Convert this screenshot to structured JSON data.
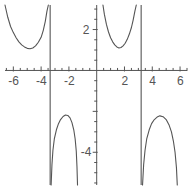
{
  "chart_data": {
    "type": "line",
    "title": "",
    "subtitle": "",
    "xlabel": "",
    "ylabel": "",
    "xlim": [
      -6.6,
      6.5
    ],
    "ylim": [
      -5.6,
      3.2
    ],
    "grid": false,
    "legend": null,
    "axis_color": "#555555",
    "curve_color": "#555555",
    "background": "#ffffff",
    "x_ticks_labeled": [
      -6,
      -4,
      -2,
      2,
      4,
      6
    ],
    "x_tick_labels": [
      "-6",
      "-4",
      "-2",
      "2",
      "4",
      "6"
    ],
    "x_minor_tick_step": 0.5,
    "y_ticks_labeled": [
      2,
      -4
    ],
    "y_tick_labels": [
      "2",
      "-4"
    ],
    "y_minor_tick_step": 0.5,
    "asymptotes": [
      -3.35,
      3.2
    ],
    "annotations": [],
    "series": [
      {
        "name": "upper-left-branch",
        "description": "U-shaped branch opening upward, left of the x = -3.35 asymptote",
        "points": [
          [
            -6.6,
            3.2
          ],
          [
            -6.4,
            2.6
          ],
          [
            -6.2,
            2.15
          ],
          [
            -6.0,
            1.85
          ],
          [
            -5.8,
            1.6
          ],
          [
            -5.6,
            1.4
          ],
          [
            -5.4,
            1.25
          ],
          [
            -5.2,
            1.15
          ],
          [
            -5.0,
            1.08
          ],
          [
            -4.8,
            1.06
          ],
          [
            -4.6,
            1.1
          ],
          [
            -4.4,
            1.2
          ],
          [
            -4.2,
            1.38
          ],
          [
            -4.0,
            1.62
          ],
          [
            -3.85,
            1.95
          ],
          [
            -3.7,
            2.4
          ],
          [
            -3.58,
            2.9
          ],
          [
            -3.48,
            3.2
          ]
        ]
      },
      {
        "name": "upper-right-branch",
        "description": "U-shaped branch opening upward, between the y-axis and the x = 3.2 asymptote",
        "points": [
          [
            0.45,
            3.2
          ],
          [
            0.55,
            2.75
          ],
          [
            0.7,
            2.25
          ],
          [
            0.85,
            1.88
          ],
          [
            1.0,
            1.6
          ],
          [
            1.15,
            1.4
          ],
          [
            1.3,
            1.25
          ],
          [
            1.45,
            1.15
          ],
          [
            1.6,
            1.1
          ],
          [
            1.75,
            1.12
          ],
          [
            1.9,
            1.2
          ],
          [
            2.05,
            1.33
          ],
          [
            2.2,
            1.52
          ],
          [
            2.35,
            1.78
          ],
          [
            2.5,
            2.1
          ],
          [
            2.62,
            2.45
          ],
          [
            2.75,
            2.9
          ],
          [
            2.85,
            3.2
          ]
        ]
      },
      {
        "name": "lower-middle-branch",
        "description": "Inverted U (arch) below the x-axis, just right of the x = -3.35 asymptote",
        "points": [
          [
            -3.28,
            -5.6
          ],
          [
            -3.22,
            -4.6
          ],
          [
            -3.15,
            -3.9
          ],
          [
            -3.05,
            -3.35
          ],
          [
            -2.9,
            -2.9
          ],
          [
            -2.75,
            -2.6
          ],
          [
            -2.6,
            -2.4
          ],
          [
            -2.42,
            -2.25
          ],
          [
            -2.25,
            -2.18
          ],
          [
            -2.08,
            -2.2
          ],
          [
            -1.92,
            -2.32
          ],
          [
            -1.78,
            -2.55
          ],
          [
            -1.65,
            -2.9
          ],
          [
            -1.55,
            -3.35
          ],
          [
            -1.47,
            -3.95
          ],
          [
            -1.42,
            -4.7
          ],
          [
            -1.38,
            -5.6
          ]
        ]
      },
      {
        "name": "lower-right-branch",
        "description": "Inverted U (arch) below the x-axis, just right of the x = 3.2 asymptote",
        "points": [
          [
            3.3,
            -5.6
          ],
          [
            3.38,
            -4.6
          ],
          [
            3.48,
            -3.9
          ],
          [
            3.6,
            -3.35
          ],
          [
            3.78,
            -2.9
          ],
          [
            3.95,
            -2.6
          ],
          [
            4.15,
            -2.4
          ],
          [
            4.35,
            -2.28
          ],
          [
            4.55,
            -2.22
          ],
          [
            4.78,
            -2.26
          ],
          [
            5.0,
            -2.4
          ],
          [
            5.2,
            -2.65
          ],
          [
            5.38,
            -3.0
          ],
          [
            5.52,
            -3.45
          ],
          [
            5.64,
            -4.0
          ],
          [
            5.74,
            -4.75
          ],
          [
            5.8,
            -5.6
          ]
        ]
      }
    ]
  },
  "axis": {
    "x_axis_name": "horizontal-axis",
    "y_axis_name": "vertical-axis"
  }
}
